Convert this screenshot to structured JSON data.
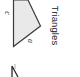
{
  "heading": {
    "title": "Triangles",
    "orientation": "rotated 90deg clockwise"
  },
  "figure": {
    "shape": "triangle",
    "fill_color": "#e9e9e9",
    "stroke_color": "#3a3a3a",
    "side_labels": [
      {
        "id": "c",
        "text": "c"
      },
      {
        "id": "a",
        "text": "a"
      }
    ]
  },
  "next_figure_partial": {
    "shape": "partial-glyph",
    "stroke_color": "#2a2a2a"
  }
}
